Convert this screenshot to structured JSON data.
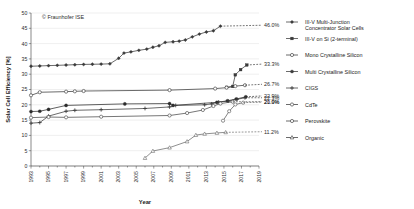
{
  "credit": "© Fraunhofer ISE",
  "chart_data": {
    "type": "line",
    "title": "",
    "xlabel": "Year",
    "ylabel": "Solar Cell Efficiency [%]",
    "xlim": [
      1993,
      2019
    ],
    "ylim": [
      0,
      50
    ],
    "xticks": [
      1993,
      1995,
      1997,
      1999,
      2001,
      2003,
      2005,
      2007,
      2009,
      2011,
      2013,
      2015,
      2017,
      2019
    ],
    "yticks": [
      0,
      5,
      10,
      15,
      20,
      25,
      30,
      35,
      40,
      45,
      50
    ],
    "grid": "horizontal",
    "legend_position": "right",
    "series": [
      {
        "name": "III-V Multi-Junction Concentrator Solar Cells",
        "marker": "filled-diamond",
        "color": "#3a3a3a",
        "end_label": "46.0%",
        "end_label_y": 46.0,
        "points": [
          [
            1993,
            32.6
          ],
          [
            1994,
            32.7
          ],
          [
            1995,
            32.8
          ],
          [
            1996,
            32.9
          ],
          [
            1997,
            33.0
          ],
          [
            1998,
            33.1
          ],
          [
            1999,
            33.2
          ],
          [
            2000,
            33.25
          ],
          [
            2001,
            33.3
          ],
          [
            2002,
            33.4
          ],
          [
            2003,
            35.2
          ],
          [
            2003.6,
            36.9
          ],
          [
            2004.4,
            37.3
          ],
          [
            2005.3,
            37.8
          ],
          [
            2006.2,
            38.2
          ],
          [
            2006.9,
            38.8
          ],
          [
            2007.6,
            39.3
          ],
          [
            2008.3,
            40.4
          ],
          [
            2009.2,
            40.6
          ],
          [
            2009.9,
            40.8
          ],
          [
            2010.6,
            41.2
          ],
          [
            2011.4,
            42.2
          ],
          [
            2012.2,
            43.1
          ],
          [
            2013.0,
            43.8
          ],
          [
            2013.8,
            44.2
          ],
          [
            2014.6,
            45.7
          ]
        ]
      },
      {
        "name": "III-V on Si (2-terminal)",
        "marker": "filled-square",
        "color": "#3a3a3a",
        "end_label": "33.3%",
        "end_label_y": 33.3,
        "points": [
          [
            2015.3,
            25.7
          ],
          [
            2016.0,
            26.0
          ],
          [
            2016.3,
            29.8
          ],
          [
            2016.9,
            31.5
          ],
          [
            2017.6,
            33.0
          ]
        ]
      },
      {
        "name": "Mono Crystalline Silicon",
        "marker": "open-circle",
        "color": "#3a3a3a",
        "end_label": "26.7%",
        "end_label_y": 26.7,
        "points": [
          [
            1993,
            23.1
          ],
          [
            1994,
            24.1
          ],
          [
            1997,
            24.3
          ],
          [
            1998,
            24.4
          ],
          [
            1999,
            24.5
          ],
          [
            2008.8,
            24.8
          ],
          [
            2014,
            25.3
          ],
          [
            2015.3,
            25.6
          ],
          [
            2016.3,
            26.1
          ],
          [
            2017.4,
            26.4
          ]
        ]
      },
      {
        "name": "Multi Crystalline Silicon",
        "marker": "filled-circle",
        "color": "#2b2b2b",
        "end_label": "22.9%",
        "end_label_y": 22.9,
        "points": [
          [
            1993,
            17.8
          ],
          [
            1994,
            17.9
          ],
          [
            1995,
            18.5
          ],
          [
            1997,
            19.8
          ],
          [
            2003.7,
            20.3
          ],
          [
            2008.8,
            20.4
          ],
          [
            2009.2,
            19.8
          ],
          [
            2014.2,
            20.8
          ],
          [
            2015.4,
            21.3
          ],
          [
            2016.4,
            21.9
          ],
          [
            2017.5,
            22.6
          ]
        ]
      },
      {
        "name": "CIGS",
        "marker": "plus-cross",
        "color": "#3a3a3a",
        "end_label": "22.3%",
        "end_label_y": 22.3,
        "points": [
          [
            1993,
            14.0
          ],
          [
            1994,
            14.2
          ],
          [
            1995,
            16.3
          ],
          [
            1997,
            17.9
          ],
          [
            1998,
            18.2
          ],
          [
            2001,
            18.4
          ],
          [
            2006,
            18.8
          ],
          [
            2008.8,
            19.3
          ],
          [
            2009.5,
            19.8
          ],
          [
            2012.8,
            20.0
          ],
          [
            2013.6,
            20.3
          ],
          [
            2014.4,
            20.9
          ],
          [
            2015.5,
            21.2
          ],
          [
            2016.5,
            21.8
          ],
          [
            2017.4,
            22.3
          ]
        ]
      },
      {
        "name": "CdTe",
        "marker": "open-circle",
        "color": "#4a4a4a",
        "end_label": "21.0%",
        "end_label_y": 21.0,
        "points": [
          [
            1993,
            15.8
          ],
          [
            1995,
            16.0
          ],
          [
            1997,
            15.9
          ],
          [
            2001,
            16.1
          ],
          [
            2008.8,
            16.5
          ],
          [
            2010.8,
            17.3
          ],
          [
            2012.6,
            18.3
          ],
          [
            2013.8,
            19.6
          ],
          [
            2014.6,
            20.4
          ],
          [
            2016.0,
            21.0
          ]
        ]
      },
      {
        "name": "Perovskite",
        "marker": "open-circle",
        "color": "#5a5a5a",
        "end_label": "20.9%",
        "end_label_y": 20.9,
        "points": [
          [
            2014.9,
            14.8
          ],
          [
            2015.6,
            17.9
          ],
          [
            2016.3,
            20.1
          ],
          [
            2017.2,
            20.7
          ]
        ]
      },
      {
        "name": "Organic",
        "marker": "open-triangle",
        "color": "#6a6a6a",
        "end_label": "11.2%",
        "end_label_y": 11.2,
        "points": [
          [
            2006.0,
            2.6
          ],
          [
            2006.9,
            4.9
          ],
          [
            2008.8,
            6.0
          ],
          [
            2010.8,
            8.0
          ],
          [
            2011.8,
            10.1
          ],
          [
            2012.8,
            10.5
          ],
          [
            2014.2,
            10.8
          ],
          [
            2015.2,
            11.0
          ]
        ]
      }
    ]
  },
  "legend": {
    "items": [
      {
        "label_line1": "III-V Multi-Junction",
        "label_line2": "Concentrator Solar Cells",
        "marker": "filled-diamond"
      },
      {
        "label_line1": "III-V on Si (2-terminal)",
        "label_line2": "",
        "marker": "filled-square"
      },
      {
        "label_line1": "Mono Crystalline Silicon",
        "label_line2": "",
        "marker": "open-circle"
      },
      {
        "label_line1": "Multi Crystalline Silicon",
        "label_line2": "",
        "marker": "filled-circle"
      },
      {
        "label_line1": "CIGS",
        "label_line2": "",
        "marker": "plus-cross"
      },
      {
        "label_line1": "CdTe",
        "label_line2": "",
        "marker": "open-circle"
      },
      {
        "label_line1": "Perovskite",
        "label_line2": "",
        "marker": "open-circle"
      },
      {
        "label_line1": "Organic",
        "label_line2": "",
        "marker": "open-triangle"
      }
    ]
  }
}
